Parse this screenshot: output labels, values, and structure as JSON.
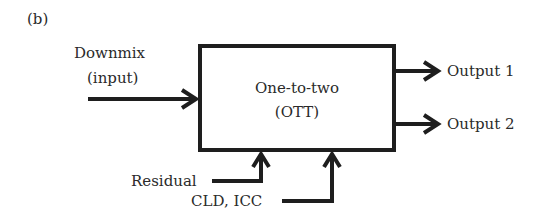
{
  "panel_label": "(b)",
  "input": {
    "line1": "Downmix",
    "line2": "(input)"
  },
  "block": {
    "line1": "One-to-two",
    "line2": "(OTT)"
  },
  "outputs": [
    {
      "label": "Output 1"
    },
    {
      "label": "Output 2"
    }
  ],
  "side_inputs": [
    {
      "label": "Residual"
    },
    {
      "label": "CLD, ICC"
    }
  ],
  "colors": {
    "stroke": "#1e1e1e",
    "background": "#ffffff"
  }
}
